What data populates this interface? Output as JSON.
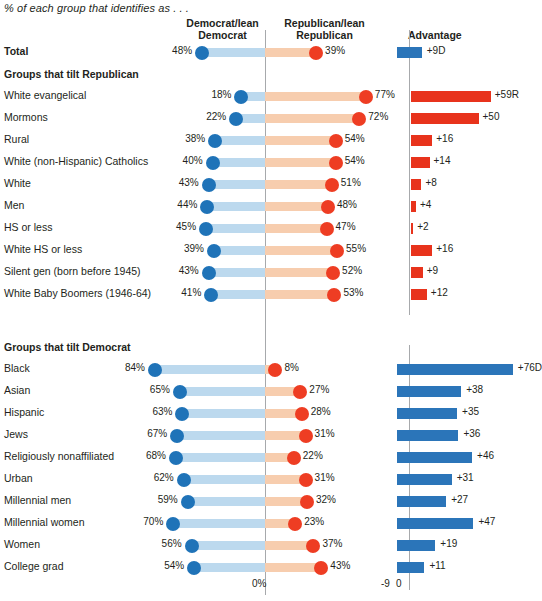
{
  "subtitle": "% of each group that identifies as . . .",
  "headers": {
    "dem": "Democrat/lean\nDemocrat",
    "dem_line1": "Democrat/lean",
    "dem_line2": "Democrat",
    "rep_line1": "Republican/lean",
    "rep_line2": "Republican",
    "advantage": "Advantage"
  },
  "group_headings": {
    "republican": "Groups that tilt Republican",
    "democrat": "Groups that tilt Democrat"
  },
  "axis": {
    "zero_pct": "0%",
    "neg9": "-9",
    "zero": "0"
  },
  "colors": {
    "dem_bar": "#bcd9ee",
    "dem_dot": "#1f73b8",
    "rep_bar": "#f7cdae",
    "rep_dot": "#ee3d23",
    "adv_dem": "#2b75b9",
    "adv_rep": "#e8331c",
    "axis": "#a7a9ac",
    "text": "#231f20"
  },
  "chart_data": {
    "type": "bar",
    "title": "",
    "subtitle": "% of each group that identifies as . . .",
    "xlabel": "",
    "ylabel": "",
    "grid": false,
    "legend_position": "top",
    "series": [
      {
        "name": "Democrat/lean Democrat",
        "color": "#1f73b8"
      },
      {
        "name": "Republican/lean Republican",
        "color": "#ee3d23"
      },
      {
        "name": "Advantage",
        "color": "#2b75b9"
      }
    ],
    "axis_ranges": {
      "main_pct": [
        0,
        100
      ],
      "advantage": [
        -9,
        80
      ]
    },
    "sections": [
      {
        "heading": "",
        "rows": [
          {
            "label": "Total",
            "bold": true,
            "dem": 48,
            "rep": 39,
            "dem_text": "48%",
            "rep_text": "39%",
            "advantage": 9,
            "advantage_text": "+9D",
            "advantage_party": "D"
          }
        ]
      },
      {
        "heading": "Groups that tilt Republican",
        "rows": [
          {
            "label": "White evangelical",
            "dem": 18,
            "rep": 77,
            "dem_text": "18%",
            "rep_text": "77%",
            "advantage": 59,
            "advantage_text": "+59R",
            "advantage_party": "R"
          },
          {
            "label": "Mormons",
            "dem": 22,
            "rep": 72,
            "dem_text": "22%",
            "rep_text": "72%",
            "advantage": 50,
            "advantage_text": "+50",
            "advantage_party": "R"
          },
          {
            "label": "Rural",
            "dem": 38,
            "rep": 54,
            "dem_text": "38%",
            "rep_text": "54%",
            "advantage": 16,
            "advantage_text": "+16",
            "advantage_party": "R"
          },
          {
            "label": "White (non-Hispanic) Catholics",
            "dem": 40,
            "rep": 54,
            "dem_text": "40%",
            "rep_text": "54%",
            "advantage": 14,
            "advantage_text": "+14",
            "advantage_party": "R"
          },
          {
            "label": "White",
            "dem": 43,
            "rep": 51,
            "dem_text": "43%",
            "rep_text": "51%",
            "advantage": 8,
            "advantage_text": "+8",
            "advantage_party": "R"
          },
          {
            "label": "Men",
            "dem": 44,
            "rep": 48,
            "dem_text": "44%",
            "rep_text": "48%",
            "advantage": 4,
            "advantage_text": "+4",
            "advantage_party": "R"
          },
          {
            "label": "HS or less",
            "dem": 45,
            "rep": 47,
            "dem_text": "45%",
            "rep_text": "47%",
            "advantage": 2,
            "advantage_text": "+2",
            "advantage_party": "R"
          },
          {
            "label": "White HS or less",
            "dem": 39,
            "rep": 55,
            "dem_text": "39%",
            "rep_text": "55%",
            "advantage": 16,
            "advantage_text": "+16",
            "advantage_party": "R"
          },
          {
            "label": "Silent gen (born before 1945)",
            "dem": 43,
            "rep": 52,
            "dem_text": "43%",
            "rep_text": "52%",
            "advantage": 9,
            "advantage_text": "+9",
            "advantage_party": "R"
          },
          {
            "label": "White Baby Boomers (1946-64)",
            "dem": 41,
            "rep": 53,
            "dem_text": "41%",
            "rep_text": "53%",
            "advantage": 12,
            "advantage_text": "+12",
            "advantage_party": "R"
          }
        ]
      },
      {
        "heading": "Groups that tilt Democrat",
        "rows": [
          {
            "label": "Black",
            "dem": 84,
            "rep": 8,
            "dem_text": "84%",
            "rep_text": "8%",
            "advantage": 76,
            "advantage_text": "+76D",
            "advantage_party": "D"
          },
          {
            "label": "Asian",
            "dem": 65,
            "rep": 27,
            "dem_text": "65%",
            "rep_text": "27%",
            "advantage": 38,
            "advantage_text": "+38",
            "advantage_party": "D"
          },
          {
            "label": "Hispanic",
            "dem": 63,
            "rep": 28,
            "dem_text": "63%",
            "rep_text": "28%",
            "advantage": 35,
            "advantage_text": "+35",
            "advantage_party": "D"
          },
          {
            "label": "Jews",
            "dem": 67,
            "rep": 31,
            "dem_text": "67%",
            "rep_text": "31%",
            "advantage": 36,
            "advantage_text": "+36",
            "advantage_party": "D"
          },
          {
            "label": "Religiously nonaffiliated",
            "dem": 68,
            "rep": 22,
            "dem_text": "68%",
            "rep_text": "22%",
            "advantage": 46,
            "advantage_text": "+46",
            "advantage_party": "D"
          },
          {
            "label": "Urban",
            "dem": 62,
            "rep": 31,
            "dem_text": "62%",
            "rep_text": "31%",
            "advantage": 31,
            "advantage_text": "+31",
            "advantage_party": "D"
          },
          {
            "label": "Millennial men",
            "dem": 59,
            "rep": 32,
            "dem_text": "59%",
            "rep_text": "32%",
            "advantage": 27,
            "advantage_text": "+27",
            "advantage_party": "D"
          },
          {
            "label": "Millennial women",
            "dem": 70,
            "rep": 23,
            "dem_text": "70%",
            "rep_text": "23%",
            "advantage": 47,
            "advantage_text": "+47",
            "advantage_party": "D"
          },
          {
            "label": "Women",
            "dem": 56,
            "rep": 37,
            "dem_text": "56%",
            "rep_text": "37%",
            "advantage": 19,
            "advantage_text": "+19",
            "advantage_party": "D"
          },
          {
            "label": "College grad",
            "dem": 54,
            "rep": 43,
            "dem_text": "54%",
            "rep_text": "43%",
            "advantage": 11,
            "advantage_text": "+11",
            "advantage_party": "D"
          }
        ]
      }
    ]
  }
}
